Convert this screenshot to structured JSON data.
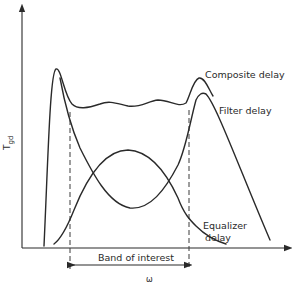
{
  "diagram": {
    "type": "group-delay equalization",
    "y_axis_label": "T",
    "y_axis_label_subscript": "gd",
    "x_axis_label": "ω",
    "band_label": "Band of interest",
    "curves": [
      {
        "name": "composite",
        "label": "Composite delay"
      },
      {
        "name": "filter",
        "label": "Filter delay"
      },
      {
        "name": "equalizer",
        "label_line1": "Equalizer",
        "label_line2": "delay"
      }
    ],
    "colors": {
      "ink": "#2a2a2a",
      "background": "#ffffff"
    }
  }
}
